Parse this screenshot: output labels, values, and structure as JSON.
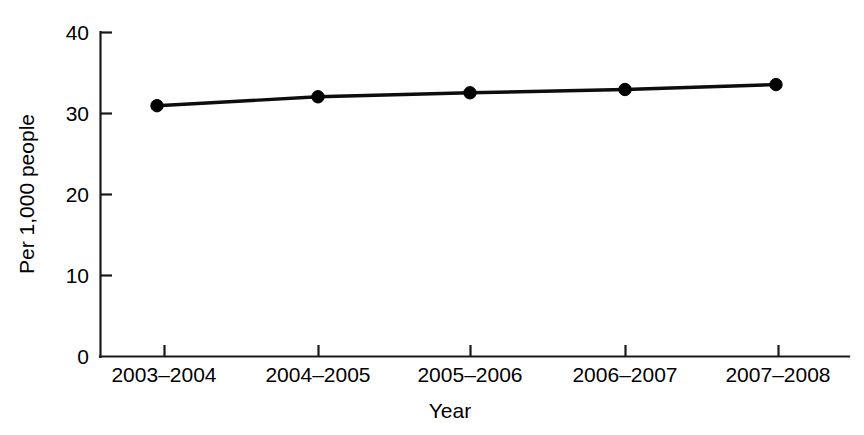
{
  "chart_data": {
    "type": "line",
    "title": "",
    "subtitle": "",
    "xlabel": "Year",
    "ylabel": "Per 1,000 people",
    "categories": [
      "2003–2004",
      "2004–2005",
      "2005–2006",
      "2006–2007",
      "2007–2008"
    ],
    "values": [
      30.9,
      32.0,
      32.5,
      32.9,
      33.5
    ],
    "series": [
      {
        "name": "Rate per 1,000 people",
        "values": [
          30.9,
          32.0,
          32.5,
          32.9,
          33.5
        ]
      }
    ],
    "ylim": [
      0,
      40
    ],
    "yticks": [
      0,
      10,
      20,
      30,
      40
    ],
    "ytick_labels": [
      "0",
      "10",
      "20",
      "30",
      "40"
    ],
    "xtick_labels": [
      "2003–2004",
      "2004–2005",
      "2005–2006",
      "2006–2007",
      "2007–2008"
    ],
    "grid": false,
    "legend": false,
    "legend_position": "none",
    "marker": "filled-circle",
    "line_color": "#0d0d0d",
    "marker_color": "#000000",
    "axis_color": "#1a1a1a",
    "background_color": "#ffffff"
  },
  "axes": {
    "y_label_text": "Per 1,000 people",
    "x_label_text": "Year",
    "y_tick_0": "0",
    "y_tick_1": "10",
    "y_tick_2": "20",
    "y_tick_3": "30",
    "y_tick_4": "40",
    "x_tick_0": "2003–2004",
    "x_tick_1": "2004–2005",
    "x_tick_2": "2005–2006",
    "x_tick_3": "2006–2007",
    "x_tick_4": "2007–2008"
  }
}
